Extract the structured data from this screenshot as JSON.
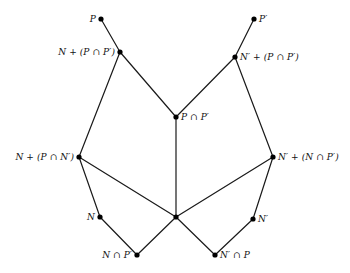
{
  "figure": {
    "type": "lattice-diagram",
    "title": "",
    "background_color": "#ffffff",
    "edge_color": "#1a1a1a",
    "node_color": "#000000",
    "width": 350,
    "height": 273
  },
  "nodes": [
    {
      "id": "P",
      "label": "P",
      "x": 101,
      "y": 19,
      "label_side": "left"
    },
    {
      "id": "Pp",
      "label": "P′",
      "x": 254,
      "y": 19,
      "label_side": "right"
    },
    {
      "id": "N_PPp",
      "label": "N + (P ∩ P′)",
      "x": 120,
      "y": 52,
      "label_side": "left"
    },
    {
      "id": "Np_PPp",
      "label": "N′ + (P ∩ P′)",
      "x": 235,
      "y": 57,
      "label_side": "right"
    },
    {
      "id": "PPp",
      "label": "P ∩ P′",
      "x": 176,
      "y": 117,
      "label_side": "right"
    },
    {
      "id": "N_PNp",
      "label": "N + (P ∩ N′)",
      "x": 79,
      "y": 157,
      "label_side": "left"
    },
    {
      "id": "Np_NPp",
      "label": "N′ + (N ∩ P′)",
      "x": 273,
      "y": 157,
      "label_side": "right"
    },
    {
      "id": "N",
      "label": "N",
      "x": 100,
      "y": 217,
      "label_side": "left"
    },
    {
      "id": "Np",
      "label": "N′",
      "x": 253,
      "y": 219,
      "label_side": "right"
    },
    {
      "id": "junction",
      "label": "",
      "x": 176,
      "y": 217,
      "label_side": "right"
    },
    {
      "id": "N_cap_Pp",
      "label": "N ∩ P′",
      "x": 137,
      "y": 255,
      "label_side": "left"
    },
    {
      "id": "Np_cap_P",
      "label": "N′ ∩ P",
      "x": 215,
      "y": 255,
      "label_side": "right"
    }
  ],
  "edges": [
    {
      "from": "P",
      "to": "N_PPp"
    },
    {
      "from": "Pp",
      "to": "Np_PPp"
    },
    {
      "from": "N_PPp",
      "to": "PPp"
    },
    {
      "from": "Np_PPp",
      "to": "PPp"
    },
    {
      "from": "N_PPp",
      "to": "N_PNp"
    },
    {
      "from": "Np_PPp",
      "to": "Np_NPp"
    },
    {
      "from": "PPp",
      "to": "junction"
    },
    {
      "from": "N_PNp",
      "to": "N"
    },
    {
      "from": "Np_NPp",
      "to": "Np"
    },
    {
      "from": "N_PNp",
      "to": "junction"
    },
    {
      "from": "Np_NPp",
      "to": "junction"
    },
    {
      "from": "N",
      "to": "N_cap_Pp"
    },
    {
      "from": "Np",
      "to": "Np_cap_P"
    },
    {
      "from": "N_cap_Pp",
      "to": "junction"
    },
    {
      "from": "Np_cap_P",
      "to": "junction"
    }
  ]
}
